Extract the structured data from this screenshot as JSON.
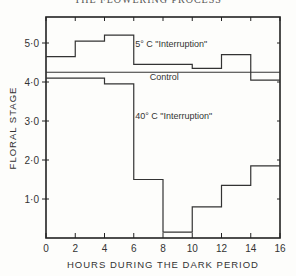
{
  "header": {
    "running_title": "THE FLOWERING PROCESS"
  },
  "chart_data": {
    "type": "line",
    "step": true,
    "title": "",
    "xlabel": "HOURS DURING THE DARK PERIOD",
    "ylabel": "FLORAL STAGE",
    "xlim": [
      0,
      16
    ],
    "ylim": [
      0,
      5.5
    ],
    "x_ticks": [
      "0",
      "2",
      "4",
      "6",
      "8",
      "10",
      "12",
      "14",
      "16"
    ],
    "y_ticks": [
      "1·0",
      "2·0",
      "3·0",
      "4·0",
      "5·0"
    ],
    "grid": false,
    "x_bins": [
      [
        0,
        2
      ],
      [
        2,
        4
      ],
      [
        4,
        6
      ],
      [
        6,
        8
      ],
      [
        8,
        10
      ],
      [
        10,
        12
      ],
      [
        12,
        14
      ],
      [
        14,
        16
      ]
    ],
    "series": [
      {
        "name": "5° C \"Interruption\"",
        "values": [
          4.65,
          5.05,
          5.2,
          4.45,
          4.45,
          4.35,
          4.7,
          4.05
        ]
      },
      {
        "name": "Control",
        "values": [
          4.25,
          4.25,
          4.25,
          4.25,
          4.25,
          4.25,
          4.25,
          4.25
        ]
      },
      {
        "name": "40° C \"Interruption\"",
        "values": [
          4.1,
          4.1,
          3.95,
          1.5,
          0.15,
          0.8,
          1.35,
          1.85
        ]
      }
    ],
    "annotations": [
      {
        "text": "5° C \"Interruption\"",
        "x": 6.1,
        "y": 4.9
      },
      {
        "text": "Control",
        "x": 7.1,
        "y": 4.05
      },
      {
        "text": "40° C \"Interruption\"",
        "x": 6.1,
        "y": 3.05
      }
    ]
  }
}
